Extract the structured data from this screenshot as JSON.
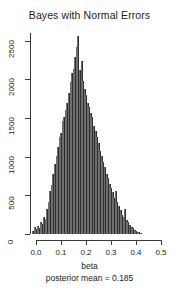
{
  "chart_data": {
    "type": "bar",
    "title": "Bayes with Normal Errors",
    "xlabel": "beta",
    "ylabel": "",
    "subtitle": "posterior mean =  0.185",
    "grid": false,
    "legend": false,
    "bar_color": "#4c4c4c",
    "axis_color": "#3a3a3a",
    "xlim": [
      0.0,
      0.5
    ],
    "ylim": [
      0,
      2600
    ],
    "xticks": [
      0.0,
      0.1,
      0.2,
      0.3,
      0.4,
      0.5
    ],
    "xtick_labels": [
      "0.0",
      "0.1",
      "0.2",
      "0.3",
      "0.4",
      "0.5"
    ],
    "yticks": [
      0,
      500,
      1000,
      1500,
      2000,
      2500
    ],
    "ytick_labels": [
      "0",
      "500",
      "1000",
      "1500",
      "2000",
      "2500"
    ],
    "bin_width": 0.00625,
    "bin_centers": [
      -0.0125,
      -0.00625,
      0.0,
      0.00625,
      0.0125,
      0.01875,
      0.025,
      0.03125,
      0.0375,
      0.04375,
      0.05,
      0.05625,
      0.0625,
      0.06875,
      0.075,
      0.08125,
      0.0875,
      0.09375,
      0.1,
      0.10625,
      0.1125,
      0.11875,
      0.125,
      0.13125,
      0.1375,
      0.14375,
      0.15,
      0.15625,
      0.1625,
      0.16875,
      0.175,
      0.18125,
      0.1875,
      0.19375,
      0.2,
      0.20625,
      0.2125,
      0.21875,
      0.225,
      0.23125,
      0.2375,
      0.24375,
      0.25,
      0.25625,
      0.2625,
      0.26875,
      0.275,
      0.28125,
      0.2875,
      0.29375,
      0.3,
      0.30625,
      0.3125,
      0.31875,
      0.325,
      0.33125,
      0.3375,
      0.34375,
      0.35,
      0.35625,
      0.3625,
      0.36875,
      0.375,
      0.38125,
      0.3875,
      0.39375,
      0.4,
      0.40625,
      0.4125,
      0.41875
    ],
    "values": [
      40,
      95,
      60,
      110,
      75,
      150,
      130,
      215,
      190,
      330,
      420,
      560,
      640,
      780,
      900,
      1010,
      1120,
      1250,
      1310,
      1460,
      1520,
      1600,
      1700,
      1820,
      1960,
      2080,
      2130,
      2290,
      2420,
      2560,
      2120,
      2240,
      1980,
      1870,
      1800,
      1700,
      1640,
      1560,
      1510,
      1400,
      1330,
      1260,
      1180,
      1080,
      1010,
      930,
      870,
      780,
      720,
      650,
      600,
      540,
      470,
      560,
      420,
      360,
      310,
      250,
      220,
      330,
      180,
      150,
      120,
      95,
      75,
      55,
      45,
      30,
      20,
      12
    ],
    "peak_value": 2560,
    "peak_bin_center": 0.16875
  }
}
